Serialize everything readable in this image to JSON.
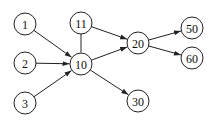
{
  "diagram": {
    "type": "directed-graph",
    "nodes": [
      {
        "id": "1",
        "label": "1",
        "x": 25,
        "y": 24
      },
      {
        "id": "2",
        "label": "2",
        "x": 25,
        "y": 63
      },
      {
        "id": "3",
        "label": "3",
        "x": 25,
        "y": 103
      },
      {
        "id": "11",
        "label": "11",
        "x": 81,
        "y": 23
      },
      {
        "id": "10",
        "label": "10",
        "x": 81,
        "y": 64
      },
      {
        "id": "20",
        "label": "20",
        "x": 138,
        "y": 43
      },
      {
        "id": "50",
        "label": "50",
        "x": 192,
        "y": 28
      },
      {
        "id": "60",
        "label": "60",
        "x": 192,
        "y": 58
      },
      {
        "id": "30",
        "label": "30",
        "x": 138,
        "y": 101
      }
    ],
    "edges": [
      {
        "from": "1",
        "to": "10",
        "arrow": true
      },
      {
        "from": "2",
        "to": "10",
        "arrow": true
      },
      {
        "from": "3",
        "to": "10",
        "arrow": true
      },
      {
        "from": "11",
        "to": "10",
        "arrow": false
      },
      {
        "from": "11",
        "to": "20",
        "arrow": true
      },
      {
        "from": "10",
        "to": "20",
        "arrow": true
      },
      {
        "from": "10",
        "to": "30",
        "arrow": true
      },
      {
        "from": "20",
        "to": "50",
        "arrow": true
      },
      {
        "from": "20",
        "to": "60",
        "arrow": true
      }
    ],
    "node_radius": 11
  }
}
